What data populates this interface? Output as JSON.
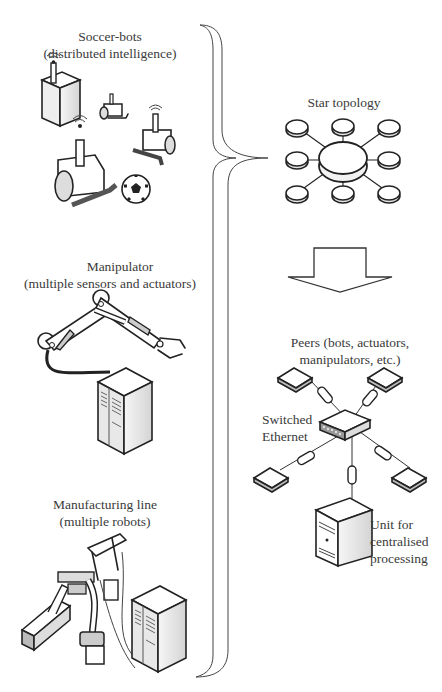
{
  "left_column": {
    "soccer": {
      "title": "Soccer-bots",
      "subtitle": "(distributed intelligence)"
    },
    "manipulator": {
      "title": "Manipulator",
      "subtitle": "(multiple sensors and actuators)"
    },
    "manufacturing": {
      "title": "Manufacturing line",
      "subtitle": "(multiple robots)"
    }
  },
  "right_column": {
    "star": {
      "title": "Star topology",
      "center_nodes": 1,
      "peripheral_nodes": 8
    },
    "peers": {
      "line1": "Peers (bots, actuators,",
      "line2": "manipulators, etc.)"
    },
    "switch": {
      "line1": "Switched",
      "line2": "Ethernet"
    },
    "unit": {
      "line1": "Unit for",
      "line2": "centralised",
      "line3": "processing"
    }
  },
  "colors": {
    "line": "#222222",
    "brace": "#555555",
    "fill_light": "#f2f2f2",
    "fill_mid": "#cfcfcf",
    "fill_dark": "#8a8a8a"
  }
}
